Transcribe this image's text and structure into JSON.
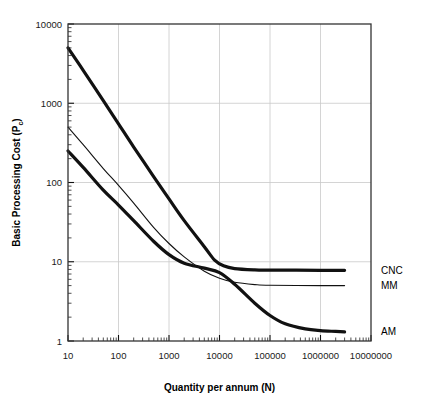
{
  "chart_data": {
    "type": "line",
    "title": "",
    "xlabel": "Quantity per annum (N)",
    "ylabel": "Basic Processing Cost (Pc)",
    "ylabel_main": "Basic Processing Cost (P",
    "ylabel_sub": "c",
    "ylabel_tail": ")",
    "xscale": "log",
    "yscale": "log",
    "xlim": [
      10,
      10000000
    ],
    "ylim": [
      1,
      10000
    ],
    "xticks": [
      10,
      100,
      1000,
      10000,
      100000,
      1000000,
      10000000
    ],
    "xtick_labels": [
      "10",
      "100",
      "1000",
      "10000",
      "100000",
      "1000000",
      "10000000"
    ],
    "yticks": [
      1,
      10,
      100,
      1000,
      10000
    ],
    "ytick_labels": [
      "1",
      "10",
      "100",
      "1000",
      "10000"
    ],
    "grid": true,
    "minor_ticks": true,
    "legend_position": "right-outside",
    "series": [
      {
        "name": "CNC",
        "label": "CNC",
        "color": "#111111",
        "width": 3.2,
        "points": [
          [
            10,
            5000
          ],
          [
            20,
            2600
          ],
          [
            50,
            1080
          ],
          [
            100,
            550
          ],
          [
            200,
            280
          ],
          [
            500,
            118
          ],
          [
            1000,
            62
          ],
          [
            2000,
            33
          ],
          [
            5000,
            15.5
          ],
          [
            8000,
            10.5
          ],
          [
            12000,
            8.9
          ],
          [
            20000,
            8.2
          ],
          [
            50000,
            7.9
          ],
          [
            100000,
            7.85
          ],
          [
            1000000,
            7.8
          ],
          [
            3000000,
            7.8
          ]
        ]
      },
      {
        "name": "MM",
        "label": "MM",
        "color": "#111111",
        "width": 1.1,
        "points": [
          [
            10,
            500
          ],
          [
            20,
            300
          ],
          [
            50,
            150
          ],
          [
            100,
            92
          ],
          [
            200,
            55
          ],
          [
            500,
            27
          ],
          [
            1000,
            17
          ],
          [
            2000,
            11.5
          ],
          [
            5000,
            7.6
          ],
          [
            10000,
            6.2
          ],
          [
            20000,
            5.5
          ],
          [
            50000,
            5.15
          ],
          [
            100000,
            5.05
          ],
          [
            1000000,
            5.0
          ],
          [
            3000000,
            5.0
          ]
        ]
      },
      {
        "name": "AM",
        "label": "AM",
        "color": "#111111",
        "width": 3.2,
        "points": [
          [
            10,
            250
          ],
          [
            20,
            155
          ],
          [
            50,
            80
          ],
          [
            100,
            52
          ],
          [
            200,
            33
          ],
          [
            500,
            18
          ],
          [
            1000,
            12.3
          ],
          [
            2000,
            9.6
          ],
          [
            5000,
            8.3
          ],
          [
            10000,
            7.3
          ],
          [
            20000,
            5.2
          ],
          [
            50000,
            3.0
          ],
          [
            100000,
            2.1
          ],
          [
            200000,
            1.65
          ],
          [
            500000,
            1.42
          ],
          [
            1000000,
            1.35
          ],
          [
            2000000,
            1.32
          ],
          [
            3000000,
            1.3
          ]
        ]
      }
    ]
  }
}
